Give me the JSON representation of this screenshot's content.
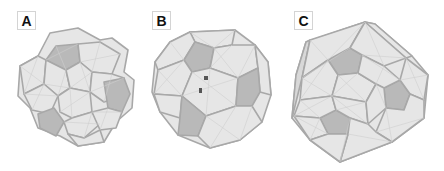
{
  "figure": {
    "panels": [
      {
        "label": "A",
        "description": "clustered polyhedral assembly with dark pentagonal faces"
      },
      {
        "label": "B",
        "description": "near-spherical truncated polyhedron with dark pentagonal faces and two small markers"
      },
      {
        "label": "C",
        "description": "dodecahedral polyhedron with dark pentagonal faces"
      }
    ],
    "colors": {
      "face_light": "#e6e6e6",
      "face_dark": "#b9b9b9",
      "edge": "#a8a8a8",
      "mesh_line": "#cfcfcf",
      "marker": "#555555"
    }
  }
}
